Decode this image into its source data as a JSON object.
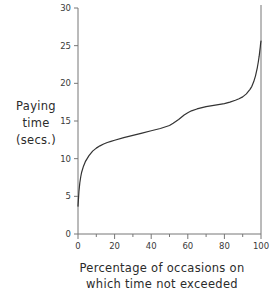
{
  "chart_data": {
    "type": "line",
    "title": "",
    "xlabel": "Percentage of occasions on which time not exceeded",
    "xlabel_lines": [
      "Percentage of occasions on",
      "which time not exceeded"
    ],
    "ylabel": "Paying time (secs.)",
    "ylabel_lines": [
      "Paying",
      "time",
      "(secs.)"
    ],
    "xlim": [
      0,
      100
    ],
    "ylim": [
      0,
      30
    ],
    "xticks": [
      0,
      20,
      40,
      60,
      80,
      100
    ],
    "xticks_minor": [
      10,
      30,
      50,
      70,
      90
    ],
    "yticks": [
      0,
      5,
      10,
      15,
      20,
      25,
      30
    ],
    "xtick_labels": [
      "0",
      "20",
      "40",
      "60",
      "80",
      "100"
    ],
    "ytick_labels": [
      "0",
      "5",
      "10",
      "15",
      "20",
      "25",
      "30"
    ],
    "grid": false,
    "legend": null,
    "line_color": "#333333",
    "axis_color": "#777777",
    "series": [
      {
        "name": "Paying time distribution",
        "x": [
          0,
          0.5,
          1,
          1.5,
          2,
          3,
          4,
          5,
          6,
          7,
          8,
          10,
          12,
          14,
          16,
          18,
          20,
          25,
          30,
          35,
          40,
          45,
          50,
          52,
          55,
          58,
          60,
          62,
          65,
          70,
          75,
          80,
          83,
          86,
          88,
          90,
          92,
          94,
          95,
          96,
          97,
          98,
          98.5,
          99,
          99.3,
          99.6,
          99.8,
          100
        ],
        "y": [
          3.7,
          5.6,
          6.8,
          7.6,
          8.2,
          9.0,
          9.6,
          10.0,
          10.4,
          10.7,
          11.0,
          11.4,
          11.7,
          11.95,
          12.15,
          12.3,
          12.45,
          12.8,
          13.1,
          13.4,
          13.7,
          14.0,
          14.4,
          14.7,
          15.2,
          15.8,
          16.1,
          16.35,
          16.6,
          16.9,
          17.1,
          17.3,
          17.5,
          17.75,
          17.95,
          18.2,
          18.6,
          19.2,
          19.6,
          20.2,
          21.0,
          22.1,
          22.8,
          23.6,
          24.2,
          24.8,
          25.3,
          25.6
        ]
      }
    ]
  }
}
